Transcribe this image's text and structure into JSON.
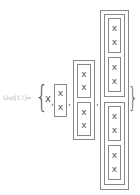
{
  "cell": {
    "label": "Out[17]=",
    "open_brace": "{",
    "close_brace": "}",
    "first_item": "x",
    "comma": ",",
    "leaf_symbol": "x"
  },
  "expression": {
    "items": [
      "x",
      {
        "box": [
          "x",
          "x"
        ]
      },
      {
        "box": [
          {
            "box": [
              "x",
              "x"
            ]
          },
          {
            "box": [
              "x",
              "x"
            ]
          }
        ]
      },
      {
        "box": [
          {
            "box": [
              {
                "box": [
                  "x",
                  "x"
                ]
              },
              {
                "box": [
                  "x",
                  "x"
                ]
              }
            ]
          },
          {
            "box": [
              {
                "box": [
                  "x",
                  "x"
                ]
              },
              {
                "box": [
                  "x",
                  "x"
                ]
              }
            ]
          }
        ]
      }
    ]
  }
}
